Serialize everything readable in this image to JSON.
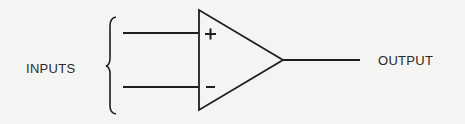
{
  "diagram": {
    "type": "operational-amplifier-symbol",
    "labels": {
      "inputs": "INPUTS",
      "output": "OUTPUT"
    },
    "terminals": {
      "non_inverting": "+",
      "inverting": "−"
    },
    "colors": {
      "ink": "#1e1e1e",
      "paper": "#f4f4f2"
    }
  }
}
